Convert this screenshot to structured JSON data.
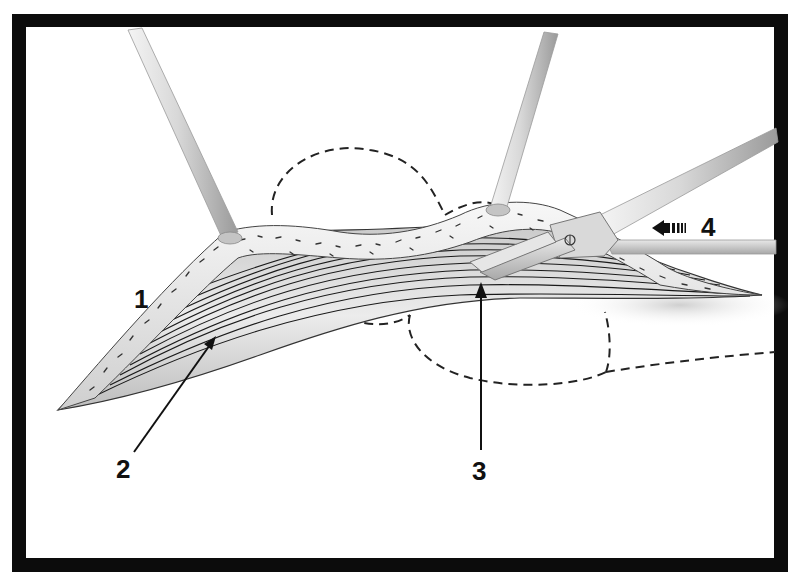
{
  "figure": {
    "type": "surgical illustration",
    "frame_color": "#0c0c0c",
    "background_color": "#ffffff",
    "callouts": [
      {
        "id": "1",
        "label": "1"
      },
      {
        "id": "2",
        "label": "2"
      },
      {
        "id": "3",
        "label": "3"
      },
      {
        "id": "4",
        "label": "4"
      }
    ],
    "elements": {
      "retractor_hooks": 2,
      "instrument": "scissors-clamp",
      "direction_arrow": "left",
      "outline_style": "dashed"
    }
  }
}
